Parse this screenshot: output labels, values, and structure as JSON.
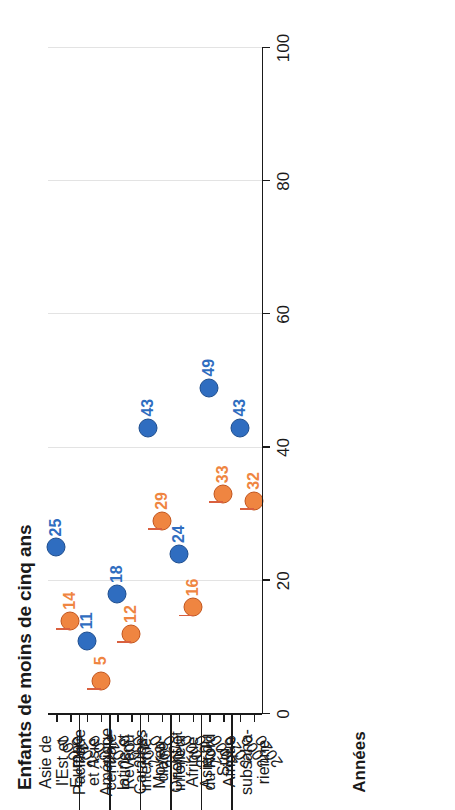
{
  "chart_data": {
    "type": "scatter",
    "subtype": "dumbbell",
    "title": "",
    "ylabel": "Enfants de moins de cinq ans",
    "xlabel": "Années",
    "grid": true,
    "legend": "none",
    "value_axis": {
      "min": 0,
      "max": 100,
      "ticks": [
        0,
        20,
        40,
        60,
        80,
        100
      ],
      "tick_labels": [
        "0",
        "20",
        "40",
        "60",
        "80",
        "100"
      ]
    },
    "series": [
      {
        "name": "2000",
        "color": "#2f6dc0",
        "values": [
          25,
          11,
          18,
          43,
          24,
          49,
          43
        ]
      },
      {
        "name": "2020",
        "color": "#ef8541",
        "values": [
          14,
          5,
          12,
          29,
          16,
          33,
          32
        ]
      }
    ],
    "connector_color": "#d9603f",
    "categories": [
      "Asie de l'Est et Pacifique",
      "Europe et Asie centrale",
      "Amérique latine et Caraïbes",
      "Revenu intermédiaire inférieur",
      "Moyen-Orient et Afrique du Nord",
      "Asie du Sud",
      "Afrique subsaharienne"
    ],
    "groups": [
      {
        "label_lines": [
          "Asie de",
          "l'Est et",
          "Pacifique"
        ],
        "points": [
          {
            "year": "2000",
            "value": 25,
            "label": "25"
          },
          {
            "year": "2020",
            "value": 14,
            "label": "14"
          }
        ]
      },
      {
        "label_lines": [
          "Europe",
          "et Asie",
          "centrale"
        ],
        "points": [
          {
            "year": "2000",
            "value": 11,
            "label": "11"
          },
          {
            "year": "2020",
            "value": 5,
            "label": "5"
          }
        ]
      },
      {
        "label_lines": [
          "Amérique",
          "latine et",
          "Caraïbes"
        ],
        "points": [
          {
            "year": "2000",
            "value": 18,
            "label": "18"
          },
          {
            "year": "2020",
            "value": 12,
            "label": "12"
          }
        ]
      },
      {
        "label_lines": [
          "Revenu",
          "intermé-",
          "diaire",
          "inférieur"
        ],
        "points": [
          {
            "year": "2000",
            "value": 43,
            "label": "43"
          },
          {
            "year": "2020",
            "value": 29,
            "label": "29"
          }
        ]
      },
      {
        "label_lines": [
          "Moyen-",
          "Orient et",
          "Afrique",
          "du Nord"
        ],
        "points": [
          {
            "year": "2000",
            "value": 24,
            "label": "24"
          },
          {
            "year": "2020",
            "value": 16,
            "label": "16"
          }
        ]
      },
      {
        "label_lines": [
          "Asie du",
          "Sud"
        ],
        "points": [
          {
            "year": "2000",
            "value": 49,
            "label": "49"
          },
          {
            "year": "2020",
            "value": 33,
            "label": "33"
          }
        ]
      },
      {
        "label_lines": [
          "Afrique",
          "subsaha-",
          "rienne"
        ],
        "points": [
          {
            "year": "2000",
            "value": 43,
            "label": "43"
          },
          {
            "year": "2020",
            "value": 32,
            "label": "32"
          }
        ]
      }
    ],
    "year_tick_labels": [
      "2000",
      "2020"
    ]
  }
}
